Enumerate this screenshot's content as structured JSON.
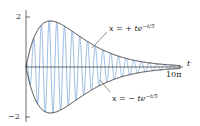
{
  "chart_data": {
    "type": "line",
    "title": "",
    "xlabel": "t",
    "ylabel": "",
    "xlim": [
      0,
      31.4159
    ],
    "ylim": [
      -2,
      2
    ],
    "x_ticks": [
      {
        "value": 31.4159,
        "label": "10π"
      }
    ],
    "y_ticks": [
      {
        "value": 2,
        "label": "2"
      },
      {
        "value": -2,
        "label": "−2"
      }
    ],
    "grid": false,
    "legend": "none",
    "series": [
      {
        "name": "x = t e^{-t/5} cos(4t)",
        "role": "oscillation",
        "color": "#8fb3e0",
        "formula": "t*exp(-t/5)*cos(4t)"
      },
      {
        "name": "x = + t e^{-t/5}",
        "role": "upper envelope",
        "color": "#222222",
        "formula": "t*exp(-t/5)"
      },
      {
        "name": "x = − t e^{-t/5}",
        "role": "lower envelope",
        "color": "#222222",
        "formula": "-t*exp(-t/5)"
      }
    ],
    "annotations": [
      {
        "text": "x = + te^{-t/5}",
        "points_to": "upper envelope"
      },
      {
        "text": "x = − te^{-t/5}",
        "points_to": "lower envelope"
      }
    ]
  },
  "labels": {
    "y_top": "2",
    "y_bottom": "−2",
    "x_axis": "t",
    "x_end": "10π",
    "upper_prefix": "x = + te",
    "upper_exp": "−t/5",
    "lower_prefix": "x = − te",
    "lower_exp": "−t/5"
  },
  "colors": {
    "oscillation": "#8fb3e0",
    "envelope": "#222222",
    "axis": "#444444"
  }
}
